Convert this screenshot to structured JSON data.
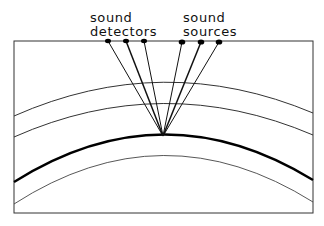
{
  "diagram": {
    "labels": {
      "detectors_line1": "sound",
      "detectors_line2": "detectors",
      "sources_line1": "sound",
      "sources_line2": "sources"
    },
    "detectors": [
      {
        "x": 108,
        "y": 41
      },
      {
        "x": 126,
        "y": 41
      },
      {
        "x": 144,
        "y": 41
      }
    ],
    "sources": [
      {
        "x": 182,
        "y": 42
      },
      {
        "x": 201,
        "y": 42
      },
      {
        "x": 219,
        "y": 42
      }
    ],
    "reflection_point": {
      "x": 163,
      "y": 136
    },
    "layers": [
      {
        "name": "layer-1",
        "weight": "thin"
      },
      {
        "name": "layer-2",
        "weight": "thin"
      },
      {
        "name": "reflector",
        "weight": "thick"
      },
      {
        "name": "layer-4",
        "weight": "thin"
      }
    ],
    "colors": {
      "line": "#111111",
      "background": "#ffffff"
    }
  }
}
